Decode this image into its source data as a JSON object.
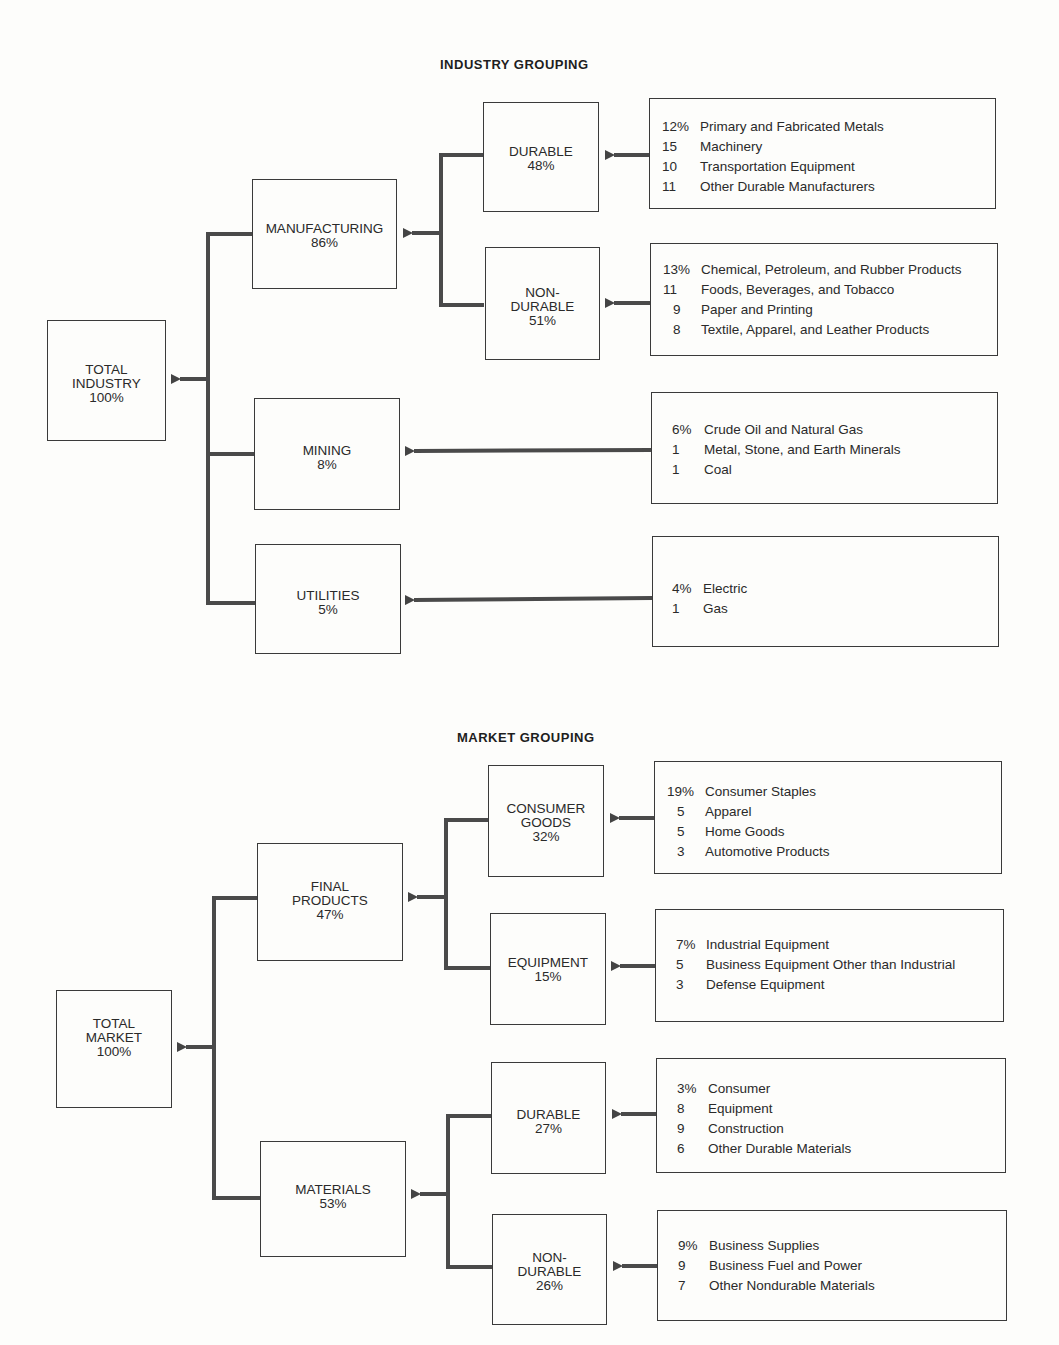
{
  "industry": {
    "title": "INDUSTRY GROUPING",
    "total": {
      "label": "TOTAL\nINDUSTRY",
      "pct": "100%"
    },
    "manufacturing": {
      "label": "MANUFACTURING",
      "pct": "86%"
    },
    "mining": {
      "label": "MINING",
      "pct": "8%"
    },
    "utilities": {
      "label": "UTILITIES",
      "pct": "5%"
    },
    "durable": {
      "label": "DURABLE",
      "pct": "48%"
    },
    "nondurable": {
      "label": "NON-\nDURABLE",
      "pct": "51%"
    },
    "durable_items": [
      {
        "value": "12%",
        "name": "Primary and Fabricated Metals"
      },
      {
        "value": "15",
        "name": "Machinery"
      },
      {
        "value": "10",
        "name": "Transportation Equipment"
      },
      {
        "value": "11",
        "name": "Other Durable Manufacturers"
      }
    ],
    "nondurable_items": [
      {
        "value": "13%",
        "name": "Chemical, Petroleum, and Rubber Products"
      },
      {
        "value": "11",
        "name": "Foods, Beverages, and Tobacco"
      },
      {
        "value": "9",
        "name": "Paper and Printing"
      },
      {
        "value": "8",
        "name": "Textile, Apparel, and Leather Products"
      }
    ],
    "mining_items": [
      {
        "value": "6%",
        "name": "Crude Oil and Natural Gas"
      },
      {
        "value": "1",
        "name": "Metal, Stone, and Earth Minerals"
      },
      {
        "value": "1",
        "name": "Coal"
      }
    ],
    "utilities_items": [
      {
        "value": "4%",
        "name": "Electric"
      },
      {
        "value": "1",
        "name": "Gas"
      }
    ]
  },
  "market": {
    "title": "MARKET GROUPING",
    "total": {
      "label": "TOTAL\nMARKET",
      "pct": "100%"
    },
    "final_products": {
      "label": "FINAL\nPRODUCTS",
      "pct": "47%"
    },
    "materials": {
      "label": "MATERIALS",
      "pct": "53%"
    },
    "consumer_goods": {
      "label": "CONSUMER\nGOODS",
      "pct": "32%"
    },
    "equipment": {
      "label": "EQUIPMENT",
      "pct": "15%"
    },
    "durable": {
      "label": "DURABLE",
      "pct": "27%"
    },
    "nondurable": {
      "label": "NON-\nDURABLE",
      "pct": "26%"
    },
    "consumer_items": [
      {
        "value": "19%",
        "name": "Consumer Staples"
      },
      {
        "value": "5",
        "name": "Apparel"
      },
      {
        "value": "5",
        "name": "Home Goods"
      },
      {
        "value": "3",
        "name": "Automotive Products"
      }
    ],
    "equipment_items": [
      {
        "value": "7%",
        "name": "Industrial Equipment"
      },
      {
        "value": "5",
        "name": "Business Equipment Other than Industrial"
      },
      {
        "value": "3",
        "name": "Defense Equipment"
      }
    ],
    "durable_items": [
      {
        "value": "3%",
        "name": "Consumer"
      },
      {
        "value": "8",
        "name": "Equipment"
      },
      {
        "value": "9",
        "name": "Construction"
      },
      {
        "value": "6",
        "name": "Other Durable Materials"
      }
    ],
    "nondurable_items": [
      {
        "value": "9%",
        "name": "Business Supplies"
      },
      {
        "value": "9",
        "name": "Business Fuel and Power"
      },
      {
        "value": "7",
        "name": "Other Nondurable Materials"
      }
    ]
  }
}
